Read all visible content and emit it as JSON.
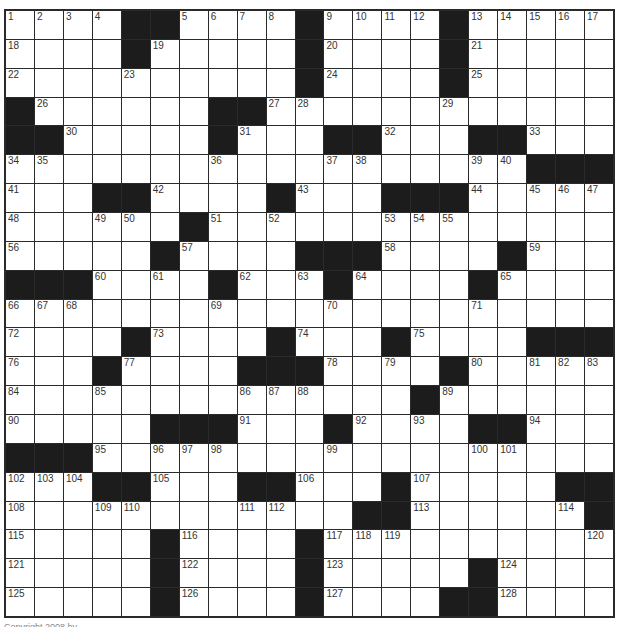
{
  "puzzle": {
    "size": 21,
    "rows": [
      "1,2,3,4,#,#,5,6,7,8,#,9,10,11,12,#,13,14,15,16,17",
      "18,.,.,.,#,19,.,.,.,.,#,20,.,.,.,#,21,.,.,.,.",
      "22,.,.,.,23,.,.,.,.,.,#,24,.,.,.,#,25,.,.,.,.",
      "#,26,.,.,.,.,.,#,#,27,28,.,.,.,.,29,.,.,.,.,.",
      "#,#,30,.,.,.,.,#,31,.,.,#,#,32,.,.,#,#,33,.,.",
      "34,35,.,.,.,.,.,36,.,.,.,37,38,.,.,.,39,40,#,#,#",
      "41,.,.,#,#,42,.,.,.,#,43,.,.,#,#,#,44,.,45,46,47",
      "48,.,.,49,50,.,#,51,.,52,.,.,.,53,54,55,.,.,.,.,.",
      "56,.,.,.,.,#,57,.,.,.,#,#,#,58,.,.,.,#,59,.,.",
      "#,#,#,60,.,61,.,#,62,.,63,#,64,.,.,.,#,65,.,.,.",
      "66,67,68,.,.,.,.,69,.,.,.,70,.,.,.,.,71,.,.,.,.",
      "72,.,.,.,#,73,.,.,.,#,74,.,.,#,75,.,.,.,#,#,#",
      "76,.,.,#,77,.,.,.,#,#,#,78,.,79,.,#,80,.,81,82,83",
      "84,.,.,85,.,.,.,.,86,87,88,.,.,.,#,89,.,.,.,.,.",
      "90,.,.,.,.,#,#,#,91,.,.,#,92,.,93,.,#,#,94,.,.",
      "#,#,#,95,.,96,97,98,.,.,.,99,.,.,.,.,100,101,.,.,.",
      "102,103,104,#,#,105,.,.,#,#,106,.,.,#,107,.,.,.,.,#,#",
      "108,.,.,109,110,.,.,.,111,112,.,.,#,#,113,.,.,.,.,114,#",
      "115,.,.,.,.,#,116,.,.,.,#,117,118,119,.,.,.,.,.,.,120",
      "121,.,.,.,.,#,122,.,.,.,#,123,.,.,.,.,#,124,.,.,.",
      "125,.,.,.,.,#,126,.,.,.,#,127,.,.,.,#,#,128,.,.,."
    ]
  },
  "footer": {
    "text": "Copyright 2008 by ..."
  },
  "colors": {
    "black_square": "#1c1c1c",
    "white_square": "#ffffff",
    "grid_line": "#2a2a2a"
  }
}
